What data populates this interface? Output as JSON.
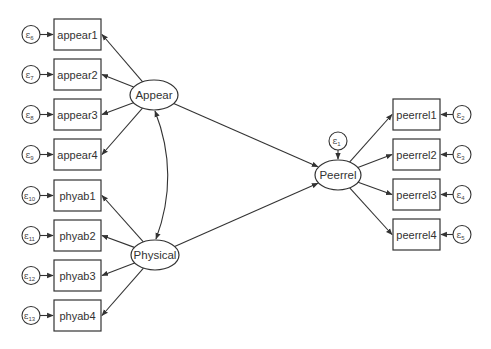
{
  "diagram": {
    "type": "structural-equation-model",
    "latent_variables": [
      {
        "id": "appear",
        "label": "Appear"
      },
      {
        "id": "physical",
        "label": "Physical"
      },
      {
        "id": "peerrel",
        "label": "Peerrel"
      }
    ],
    "observed_variables": [
      {
        "id": "appear1",
        "label": "appear1",
        "latent": "appear",
        "error": {
          "symbol": "ε",
          "sub": "6"
        }
      },
      {
        "id": "appear2",
        "label": "appear2",
        "latent": "appear",
        "error": {
          "symbol": "ε",
          "sub": "7"
        }
      },
      {
        "id": "appear3",
        "label": "appear3",
        "latent": "appear",
        "error": {
          "symbol": "ε",
          "sub": "8"
        }
      },
      {
        "id": "appear4",
        "label": "appear4",
        "latent": "appear",
        "error": {
          "symbol": "ε",
          "sub": "9"
        }
      },
      {
        "id": "phyab1",
        "label": "phyab1",
        "latent": "physical",
        "error": {
          "symbol": "ε",
          "sub": "10"
        }
      },
      {
        "id": "phyab2",
        "label": "phyab2",
        "latent": "physical",
        "error": {
          "symbol": "ε",
          "sub": "11"
        }
      },
      {
        "id": "phyab3",
        "label": "phyab3",
        "latent": "physical",
        "error": {
          "symbol": "ε",
          "sub": "12"
        }
      },
      {
        "id": "phyab4",
        "label": "phyab4",
        "latent": "physical",
        "error": {
          "symbol": "ε",
          "sub": "13"
        }
      },
      {
        "id": "peerrel1",
        "label": "peerrel1",
        "latent": "peerrel",
        "error": {
          "symbol": "ε",
          "sub": "2"
        }
      },
      {
        "id": "peerrel2",
        "label": "peerrel2",
        "latent": "peerrel",
        "error": {
          "symbol": "ε",
          "sub": "3"
        }
      },
      {
        "id": "peerrel3",
        "label": "peerrel3",
        "latent": "peerrel",
        "error": {
          "symbol": "ε",
          "sub": "4"
        }
      },
      {
        "id": "peerrel4",
        "label": "peerrel4",
        "latent": "peerrel",
        "error": {
          "symbol": "ε",
          "sub": "5"
        }
      }
    ],
    "latent_errors": [
      {
        "latent": "peerrel",
        "symbol": "ε",
        "sub": "1"
      }
    ],
    "structural_paths": [
      {
        "from": "appear",
        "to": "peerrel"
      },
      {
        "from": "physical",
        "to": "peerrel"
      }
    ],
    "covariances": [
      {
        "between": [
          "appear",
          "physical"
        ]
      }
    ]
  }
}
